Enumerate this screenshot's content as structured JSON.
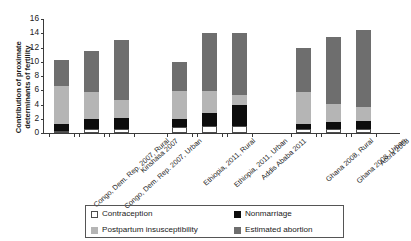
{
  "chart_data": {
    "type": "bar",
    "subtype": "stacked",
    "title": "",
    "xlabel": "",
    "ylabel": "Contribution of proximate determinants of fertility",
    "ylim": [
      0,
      16
    ],
    "yticks": [
      0,
      2,
      4,
      6,
      8,
      10,
      12,
      14,
      16
    ],
    "grid": false,
    "legend_position": "bottom",
    "categories": [
      "Congo, Dem. Rep. 2007, Rural",
      "Congo, Dem. Rep. 2007, Urban",
      "Kinshasa 2007",
      "Ethiopia, 2011, Rural",
      "Ethiopia, 2011, Urban",
      "Addis Ababa 2011",
      "Ghana 2008, Rural",
      "Ghana 2008, Urban",
      "Accra 2008"
    ],
    "series": [
      {
        "name": "Contraception",
        "color": "#ffffff",
        "values": [
          0.3,
          0.5,
          0.6,
          0.9,
          1.0,
          1.0,
          0.5,
          0.6,
          0.6
        ]
      },
      {
        "name": "Nonmarriage",
        "color": "#0d0d0d",
        "values": [
          1.0,
          1.4,
          1.5,
          1.0,
          1.8,
          3.0,
          0.8,
          1.0,
          1.1
        ]
      },
      {
        "name": "Postpartum insusceptibility",
        "color": "#b5b5b5",
        "values": [
          5.3,
          3.8,
          2.6,
          4.0,
          3.1,
          1.3,
          4.5,
          2.5,
          1.9
        ]
      },
      {
        "name": "Estimated abortion",
        "color": "#6e6e6e",
        "values": [
          3.7,
          5.8,
          8.4,
          4.0,
          8.1,
          8.7,
          6.1,
          9.4,
          10.9
        ]
      }
    ],
    "totals": [
      10.3,
      11.5,
      13.1,
      9.9,
      14.0,
      14.0,
      11.9,
      13.5,
      14.5
    ]
  },
  "legend": {
    "items": [
      {
        "label": "Contraception",
        "swatch": "contraception"
      },
      {
        "label": "Nonmarriage",
        "swatch": "nonmarriage"
      },
      {
        "label": "Postpartum insusceptibility",
        "swatch": "postpartum"
      },
      {
        "label": "Estimated abortion",
        "swatch": "abortion"
      }
    ]
  }
}
